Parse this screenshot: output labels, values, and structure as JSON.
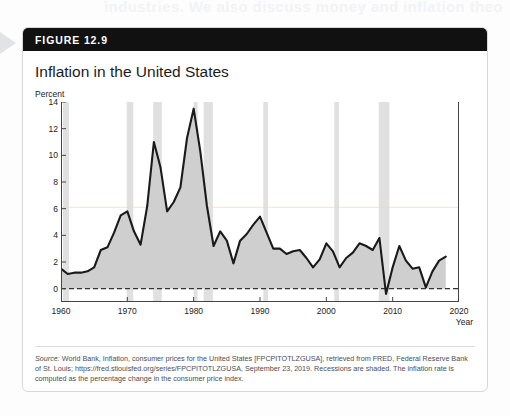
{
  "page": {
    "bleed_text": "industries. We also discuss money and inflation theory"
  },
  "figure": {
    "header_label": "FIGURE 12.9",
    "title": "Inflation in the United States",
    "source_prefix": "Source:",
    "source_text": " World Bank, Inflation, consumer prices for the United States [FPCPITOTLZGUSA], retrieved from FRED, Federal Reserve Bank of St. Louis; https://fred.stlouisfed.org/series/FPCPITOTLZGUSA, September 23, 2019. Recessions are shaded. The inflation rate is computed as the percentage change in the consumer price index."
  },
  "colors": {
    "header_bg": "#111111",
    "line": "#1a1a1a",
    "area_fill": "#cfcfcf",
    "recession_band": "#e0e0e0",
    "zero_line": "#333333",
    "grid": "#e9d7d7"
  },
  "chart_data": {
    "type": "area",
    "title": "Inflation in the United States",
    "xlabel": "Year",
    "ylabel": "Percent",
    "ylim": [
      -1,
      14
    ],
    "xlim": [
      1960,
      2020
    ],
    "yticks": [
      0,
      2,
      4,
      6,
      8,
      10,
      12,
      14
    ],
    "xticks": [
      1960,
      1970,
      1980,
      1990,
      2000,
      2010,
      2020
    ],
    "grid": false,
    "legend": "none",
    "zero_reference_line": 0,
    "series": [
      {
        "name": "Inflation rate (CPI, annual % change)",
        "x": [
          1960,
          1961,
          1962,
          1963,
          1964,
          1965,
          1966,
          1967,
          1968,
          1969,
          1970,
          1971,
          1972,
          1973,
          1974,
          1975,
          1976,
          1977,
          1978,
          1979,
          1980,
          1981,
          1982,
          1983,
          1984,
          1985,
          1986,
          1987,
          1988,
          1989,
          1990,
          1991,
          1992,
          1993,
          1994,
          1995,
          1996,
          1997,
          1998,
          1999,
          2000,
          2001,
          2002,
          2003,
          2004,
          2005,
          2006,
          2007,
          2008,
          2009,
          2010,
          2011,
          2012,
          2013,
          2014,
          2015,
          2016,
          2017,
          2018
        ],
        "values": [
          1.5,
          1.1,
          1.2,
          1.2,
          1.3,
          1.6,
          2.9,
          3.1,
          4.2,
          5.5,
          5.8,
          4.3,
          3.3,
          6.2,
          11.0,
          9.1,
          5.8,
          6.5,
          7.6,
          11.3,
          13.5,
          10.3,
          6.2,
          3.2,
          4.3,
          3.6,
          1.9,
          3.6,
          4.1,
          4.8,
          5.4,
          4.2,
          3.0,
          3.0,
          2.6,
          2.8,
          2.9,
          2.3,
          1.6,
          2.2,
          3.4,
          2.8,
          1.6,
          2.3,
          2.7,
          3.4,
          3.2,
          2.9,
          3.8,
          -0.4,
          1.6,
          3.2,
          2.1,
          1.5,
          1.6,
          0.1,
          1.3,
          2.1,
          2.4
        ]
      }
    ],
    "recession_bands": [
      {
        "start": 1960.3,
        "end": 1961.2
      },
      {
        "start": 1969.9,
        "end": 1970.9
      },
      {
        "start": 1973.9,
        "end": 1975.2
      },
      {
        "start": 1980.0,
        "end": 1980.6
      },
      {
        "start": 1981.5,
        "end": 1982.9
      },
      {
        "start": 1990.5,
        "end": 1991.2
      },
      {
        "start": 2001.2,
        "end": 2001.9
      },
      {
        "start": 2007.9,
        "end": 2009.5
      }
    ]
  }
}
